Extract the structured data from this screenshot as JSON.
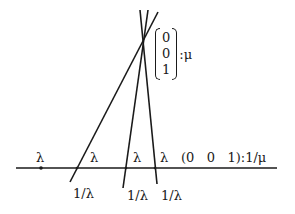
{
  "diagram": {
    "colors": {
      "line": "#1a1a1a",
      "background": "#ffffff"
    },
    "baseline": {
      "x1": 16,
      "y1": 168,
      "x2": 277,
      "y2": 168
    },
    "lines": [
      {
        "x1": 70,
        "y1": 182,
        "x2": 158,
        "y2": 12
      },
      {
        "x1": 123,
        "y1": 188,
        "x2": 148,
        "y2": 10
      },
      {
        "x1": 157,
        "y1": 184,
        "x2": 140,
        "y2": 10
      }
    ],
    "point": {
      "x": 41,
      "y": 168
    },
    "labels": {
      "lambda_point": "λ",
      "lambda_1": "λ",
      "lambda_2": "λ",
      "lambda_3": "λ",
      "inv_lambda_1": "1/λ",
      "inv_lambda_2": "1/λ",
      "inv_lambda_3": "1/λ",
      "row_vector": "(0   0   1):1/μ"
    },
    "column_vector": {
      "entries": [
        "0",
        "0",
        "1"
      ],
      "suffix": ":μ"
    }
  }
}
